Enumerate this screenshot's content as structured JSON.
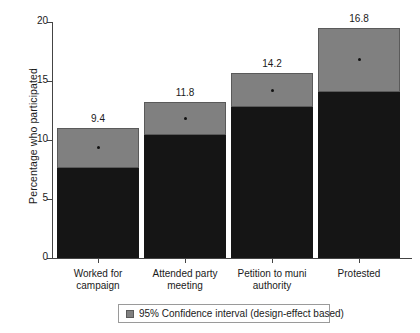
{
  "chart_data": {
    "type": "bar",
    "title": "",
    "subtitle": "",
    "xlabel": "",
    "ylabel": "Percentage who participated",
    "ylim": [
      0,
      20
    ],
    "yticks": [
      0,
      5,
      10,
      15,
      20
    ],
    "ytick_labels": [
      "0",
      "5",
      "10",
      "15",
      "20"
    ],
    "grid": false,
    "legend_position": "bottom",
    "categories": [
      "Worked for campaign",
      "Attended party meeting",
      "Petition to muni authority",
      "Protested"
    ],
    "series": [
      {
        "name": "Bar height (black)",
        "values": [
          7.6,
          10.4,
          12.8,
          14.1
        ]
      },
      {
        "name": "95% Confidence interval upper (grey)",
        "values": [
          11.0,
          13.2,
          15.7,
          19.5
        ]
      },
      {
        "name": "Point estimate",
        "values": [
          9.4,
          11.8,
          14.2,
          16.8
        ]
      }
    ],
    "data_labels": [
      "9.4",
      "11.8",
      "14.2",
      "16.8"
    ],
    "legend": [
      {
        "label": "95% Confidence interval (design-effect based)",
        "color": "#808080"
      }
    ],
    "colors": {
      "bar": "#151515",
      "ci": "#808080",
      "axis": "#444444",
      "text": "#1a1a1a"
    }
  }
}
